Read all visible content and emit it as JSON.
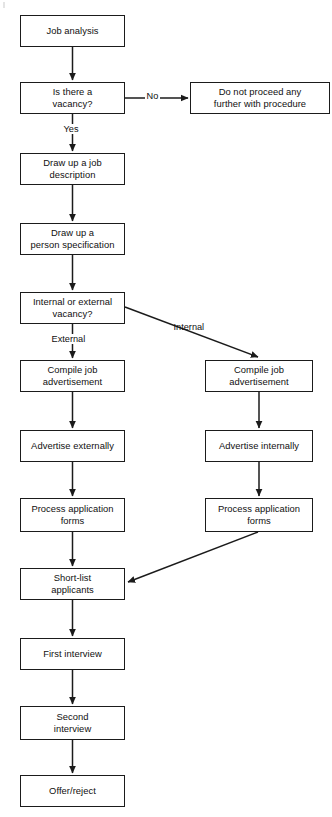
{
  "diagram": {
    "type": "flowchart",
    "canvas": {
      "width": 332,
      "height": 817
    },
    "style": {
      "background": "#ffffff",
      "box_fill": "#ffffff",
      "box_stroke": "#1b1b1b",
      "text_color": "#101010",
      "line_color": "#1b1b1b"
    },
    "nodes": [
      {
        "id": "job-analysis",
        "label": "Job analysis",
        "shape": "rectangle",
        "column": "left",
        "x": 20,
        "y": 15,
        "w": 105,
        "h": 32
      },
      {
        "id": "is-there-a-vacancy",
        "label": "Is there a\nvacancy?",
        "shape": "rectangle",
        "column": "left",
        "x": 20,
        "y": 82,
        "w": 105,
        "h": 32
      },
      {
        "id": "do-not-proceed",
        "label": "Do not proceed any\nfurther with procedure",
        "shape": "rectangle",
        "column": "right",
        "x": 190,
        "y": 82,
        "w": 140,
        "h": 32
      },
      {
        "id": "draw-up-job-description",
        "label": "Draw up a job\ndescription",
        "shape": "rectangle",
        "column": "left",
        "x": 20,
        "y": 153,
        "w": 105,
        "h": 32
      },
      {
        "id": "draw-up-person-specification",
        "label": "Draw up a\nperson specification",
        "shape": "rectangle",
        "column": "left",
        "x": 20,
        "y": 223,
        "w": 105,
        "h": 32
      },
      {
        "id": "internal-or-external-vacancy",
        "label": "Internal or external\nvacancy?",
        "shape": "rectangle",
        "column": "left",
        "x": 20,
        "y": 292,
        "w": 105,
        "h": 32
      },
      {
        "id": "compile-job-advertisement-external",
        "label": "Compile job\nadvertisement",
        "shape": "rectangle",
        "column": "left",
        "x": 20,
        "y": 360,
        "w": 105,
        "h": 32
      },
      {
        "id": "compile-job-advertisement-internal",
        "label": "Compile job\nadvertisement",
        "shape": "rectangle",
        "column": "right",
        "x": 205,
        "y": 360,
        "w": 108,
        "h": 32
      },
      {
        "id": "advertise-externally",
        "label": "Advertise externally",
        "shape": "rectangle",
        "column": "left",
        "x": 20,
        "y": 430,
        "w": 105,
        "h": 32
      },
      {
        "id": "advertise-internally",
        "label": "Advertise internally",
        "shape": "rectangle",
        "column": "right",
        "x": 205,
        "y": 430,
        "w": 108,
        "h": 32
      },
      {
        "id": "process-application-forms-external",
        "label": "Process application\nforms",
        "shape": "rectangle",
        "column": "left",
        "x": 20,
        "y": 498,
        "w": 105,
        "h": 34
      },
      {
        "id": "process-application-forms-internal",
        "label": "Process application\nforms",
        "shape": "rectangle",
        "column": "right",
        "x": 205,
        "y": 498,
        "w": 108,
        "h": 34
      },
      {
        "id": "short-list-applicants",
        "label": "Short-list\napplicants",
        "shape": "rectangle",
        "column": "left",
        "x": 20,
        "y": 568,
        "w": 105,
        "h": 32
      },
      {
        "id": "first-interview",
        "label": "First interview",
        "shape": "rectangle",
        "column": "left",
        "x": 20,
        "y": 638,
        "w": 105,
        "h": 32
      },
      {
        "id": "second-interview",
        "label": "Second\ninterview",
        "shape": "rectangle",
        "column": "left",
        "x": 20,
        "y": 706,
        "w": 105,
        "h": 34
      },
      {
        "id": "offer-reject",
        "label": "Offer/reject",
        "shape": "rectangle",
        "column": "left",
        "x": 20,
        "y": 775,
        "w": 105,
        "h": 32
      }
    ],
    "edge_labels": [
      {
        "id": "no",
        "text": "No",
        "x": 145,
        "y": 91
      },
      {
        "id": "yes",
        "text": "Yes",
        "x": 62,
        "y": 124
      },
      {
        "id": "external",
        "text": "External",
        "x": 50,
        "y": 334
      },
      {
        "id": "internal",
        "text": "Internal",
        "x": 172,
        "y": 322
      }
    ],
    "edges": [
      {
        "from": "job-analysis",
        "to": "is-there-a-vacancy",
        "label": ""
      },
      {
        "from": "is-there-a-vacancy",
        "to": "do-not-proceed",
        "label": "No"
      },
      {
        "from": "is-there-a-vacancy",
        "to": "draw-up-job-description",
        "label": "Yes"
      },
      {
        "from": "draw-up-job-description",
        "to": "draw-up-person-specification",
        "label": ""
      },
      {
        "from": "draw-up-person-specification",
        "to": "internal-or-external-vacancy",
        "label": ""
      },
      {
        "from": "internal-or-external-vacancy",
        "to": "compile-job-advertisement-external",
        "label": "External"
      },
      {
        "from": "internal-or-external-vacancy",
        "to": "compile-job-advertisement-internal",
        "label": "Internal"
      },
      {
        "from": "compile-job-advertisement-external",
        "to": "advertise-externally",
        "label": ""
      },
      {
        "from": "compile-job-advertisement-internal",
        "to": "advertise-internally",
        "label": ""
      },
      {
        "from": "advertise-externally",
        "to": "process-application-forms-external",
        "label": ""
      },
      {
        "from": "advertise-internally",
        "to": "process-application-forms-internal",
        "label": ""
      },
      {
        "from": "process-application-forms-external",
        "to": "short-list-applicants",
        "label": ""
      },
      {
        "from": "process-application-forms-internal",
        "to": "short-list-applicants",
        "label": ""
      },
      {
        "from": "short-list-applicants",
        "to": "first-interview",
        "label": ""
      },
      {
        "from": "first-interview",
        "to": "second-interview",
        "label": ""
      },
      {
        "from": "second-interview",
        "to": "offer-reject",
        "label": ""
      }
    ]
  }
}
